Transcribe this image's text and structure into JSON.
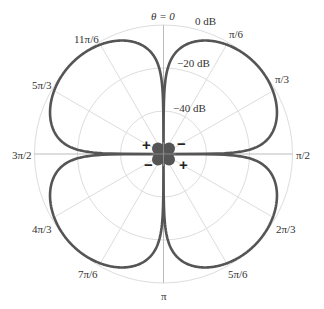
{
  "chart_data": {
    "type": "polar",
    "title": "",
    "theta_zero_label": "θ = 0",
    "radial_axis": {
      "unit": "dB",
      "ticks": [
        {
          "label": "0 dB",
          "value": 0
        },
        {
          "label": "−20 dB",
          "value": -20
        },
        {
          "label": "−40 dB",
          "value": -40
        }
      ],
      "range_db": [
        -60,
        0
      ]
    },
    "angular_ticks": [
      "θ = 0",
      "π/6",
      "π/3",
      "π/2",
      "2π/3",
      "5π/6",
      "π",
      "7π/6",
      "4π/3",
      "3π/2",
      "5π/3",
      "11π/6"
    ],
    "series": [
      {
        "name": "four-lobe (quadrupole) pattern",
        "description": "|sin(2θ)| pattern in dB, four lobes with nulls at 0, π/2, π, 3π/2",
        "lobe_peaks_theta": [
          "π/4",
          "3π/4",
          "5π/4",
          "7π/4"
        ],
        "peak_db": 0
      }
    ],
    "polarity_signs": [
      {
        "quadrant": "upper-left",
        "sign": "+"
      },
      {
        "quadrant": "upper-right",
        "sign": "−"
      },
      {
        "quadrant": "lower-left",
        "sign": "−"
      },
      {
        "quadrant": "lower-right",
        "sign": "+"
      }
    ],
    "grid": true,
    "colors": {
      "curve": "#555555",
      "grid": "#dddddd",
      "axis": "#666666"
    }
  },
  "labels": {
    "theta0": "θ = 0",
    "db0": "0 dB",
    "db20": "−20 dB",
    "db40": "−40 dB",
    "a30": "π/6",
    "a60": "π/3",
    "a90": "π/2",
    "a120": "2π/3",
    "a150": "5π/6",
    "a180": "π",
    "a210": "7π/6",
    "a240": "4π/3",
    "a270": "3π/2",
    "a300": "5π/3",
    "a330": "11π/6",
    "plus": "+",
    "minus": "−"
  }
}
